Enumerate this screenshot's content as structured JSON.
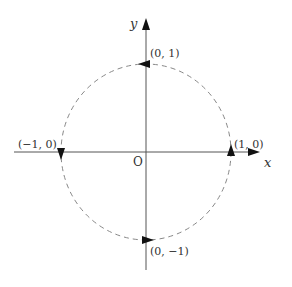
{
  "diagram": {
    "type": "unit-circle-coordinate-plane",
    "axes": {
      "x_label": "x",
      "y_label": "y",
      "origin_label": "O"
    },
    "circle": {
      "style": "dashed",
      "direction": "counterclockwise"
    },
    "points": [
      {
        "id": "top",
        "label": "(0, 1)",
        "arrow": "left"
      },
      {
        "id": "left",
        "label": "(−1, 0)",
        "arrow": "down"
      },
      {
        "id": "bottom",
        "label": "(0, −1)",
        "arrow": "right"
      },
      {
        "id": "right",
        "label": "(1, 0)",
        "arrow": "up"
      }
    ],
    "colors": {
      "axis": "#555555",
      "circle": "#888888",
      "arrow": "#111111",
      "text": "#333333"
    }
  }
}
